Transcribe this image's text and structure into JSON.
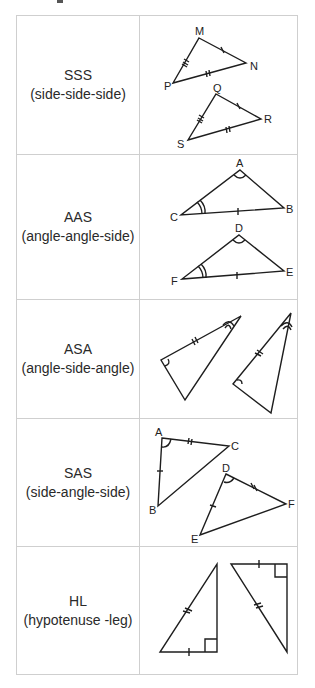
{
  "rows": [
    {
      "abbr": "SSS",
      "full": "(side-side-side)",
      "labels": [
        "M",
        "N",
        "P",
        "Q",
        "R",
        "S"
      ]
    },
    {
      "abbr": "AAS",
      "full": "(angle-angle-side)",
      "labels": [
        "A",
        "B",
        "C",
        "D",
        "E",
        "F"
      ]
    },
    {
      "abbr": "ASA",
      "full": "(angle-side-angle)",
      "labels": []
    },
    {
      "abbr": "SAS",
      "full": "(side-angle-side)",
      "labels": [
        "A",
        "C",
        "B",
        "D",
        "F",
        "E"
      ]
    },
    {
      "abbr": "HL",
      "full": "(hypotenuse -leg)",
      "labels": []
    }
  ],
  "colors": {
    "border": "#cfcfcf",
    "stroke": "#1e1e1e",
    "text": "#2a2a2a"
  }
}
